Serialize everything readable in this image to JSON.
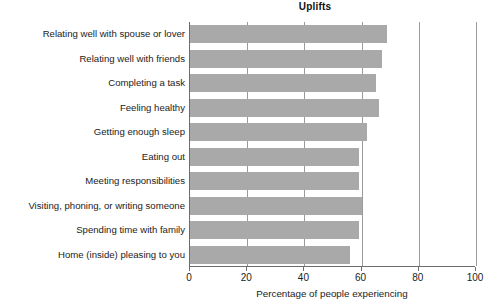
{
  "chart_data": {
    "type": "bar",
    "orientation": "horizontal",
    "title": "Uplifts",
    "xlabel": "Percentage of people experiencing",
    "ylabel": "",
    "xlim": [
      0,
      100
    ],
    "xticks": [
      0,
      20,
      40,
      60,
      80,
      100
    ],
    "xtick_labels": [
      "0",
      "20",
      "40",
      "60",
      "80",
      "100"
    ],
    "grid": "vertical",
    "legend": null,
    "bar_color": "#a9a9a9",
    "axis_color": "#6d6d6d",
    "gridline_color": "#9a9a9a",
    "categories": [
      "Relating well with spouse or lover",
      "Relating well with friends",
      "Completing a task",
      "Feeling healthy",
      "Getting enough sleep",
      "Eating out",
      "Meeting responsibilities",
      "Visiting, phoning, or writing someone",
      "Spending time with family",
      "Home (inside) pleasing to you"
    ],
    "values": [
      69,
      67,
      65,
      66,
      62,
      59,
      59,
      60,
      59,
      56
    ]
  }
}
